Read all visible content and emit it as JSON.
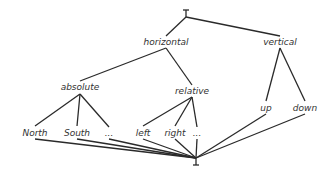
{
  "diagram": {
    "type": "hasse-lattice",
    "top": {
      "symbol": "⊤",
      "x": 186,
      "y": 13
    },
    "bottom": {
      "symbol": "⊥",
      "x": 196,
      "y": 162
    },
    "nodes": [
      {
        "id": "horizontal",
        "label": "horizontal",
        "x": 166,
        "y": 45,
        "top": 36,
        "bottom": 48
      },
      {
        "id": "vertical",
        "label": "vertical",
        "x": 280,
        "y": 45,
        "top": 36,
        "bottom": 48
      },
      {
        "id": "absolute",
        "label": "absolute",
        "x": 80,
        "y": 90,
        "top": 81,
        "bottom": 94
      },
      {
        "id": "relative",
        "label": "relative",
        "x": 192,
        "y": 94,
        "top": 85,
        "bottom": 97
      },
      {
        "id": "up",
        "label": "up",
        "x": 266,
        "y": 111,
        "top": 101,
        "bottom": 114
      },
      {
        "id": "down",
        "label": "down",
        "x": 305,
        "y": 111,
        "top": 101,
        "bottom": 114
      },
      {
        "id": "north",
        "label": "North",
        "x": 35,
        "y": 136,
        "top": 126,
        "bottom": 139
      },
      {
        "id": "south",
        "label": "South",
        "x": 77,
        "y": 136,
        "top": 126,
        "bottom": 139
      },
      {
        "id": "abs_more",
        "label": "...",
        "x": 109,
        "y": 136,
        "top": 127,
        "bottom": 139
      },
      {
        "id": "left",
        "label": "left",
        "x": 143,
        "y": 136,
        "top": 126,
        "bottom": 139
      },
      {
        "id": "right",
        "label": "right",
        "x": 175,
        "y": 136,
        "top": 126,
        "bottom": 139
      },
      {
        "id": "rel_more",
        "label": "...",
        "x": 197,
        "y": 136,
        "top": 127,
        "bottom": 139
      }
    ],
    "edges": [
      [
        "top",
        "horizontal"
      ],
      [
        "top",
        "vertical"
      ],
      [
        "horizontal",
        "absolute"
      ],
      [
        "horizontal",
        "relative"
      ],
      [
        "vertical",
        "up"
      ],
      [
        "vertical",
        "down"
      ],
      [
        "absolute",
        "north"
      ],
      [
        "absolute",
        "south"
      ],
      [
        "absolute",
        "abs_more"
      ],
      [
        "relative",
        "left"
      ],
      [
        "relative",
        "right"
      ],
      [
        "relative",
        "rel_more"
      ],
      [
        "north",
        "bottom"
      ],
      [
        "south",
        "bottom"
      ],
      [
        "abs_more",
        "bottom"
      ],
      [
        "left",
        "bottom"
      ],
      [
        "right",
        "bottom"
      ],
      [
        "rel_more",
        "bottom"
      ],
      [
        "up",
        "bottom"
      ],
      [
        "down",
        "bottom"
      ]
    ]
  }
}
